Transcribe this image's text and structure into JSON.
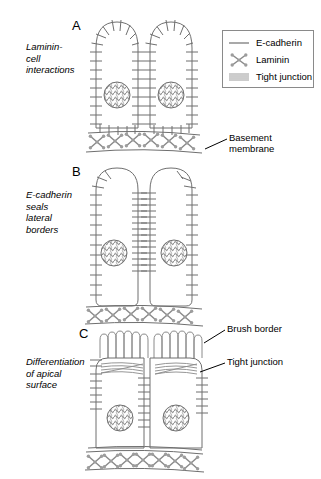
{
  "figure": {
    "background_color": "#ffffff",
    "line_color": "#6f6f6f",
    "dot_color": "#9a9a9a",
    "text_color": "#000000"
  },
  "panels": [
    {
      "letter": "A",
      "side_label": "Laminin-\ncell\ninteractions",
      "description": "Two rounded cells with E-cadherin all around, resting on a basement membrane"
    },
    {
      "letter": "B",
      "side_label": "E-cadherin\nseals\nlateral\nborders",
      "description": "Two columnar cells with E-cadherin concentrated at lateral borders"
    },
    {
      "letter": "C",
      "side_label": "Differentiation\nof apical\nsurface",
      "description": "Two polarized cells with apical brush border and tight junctions"
    }
  ],
  "legend": {
    "items": [
      {
        "label": "E-cadherin",
        "icon": "line-swatch-icon"
      },
      {
        "label": "Laminin",
        "icon": "laminin-cross-icon"
      },
      {
        "label": "Tight junction",
        "icon": "stacked-lines-icon"
      }
    ]
  },
  "callouts": [
    {
      "label": "Basement\nmembrane",
      "target": "basement-membrane-panel-a"
    },
    {
      "label": "Brush border",
      "target": "brush-border-panel-c"
    },
    {
      "label": "Tight junction",
      "target": "tight-junction-panel-c"
    }
  ]
}
